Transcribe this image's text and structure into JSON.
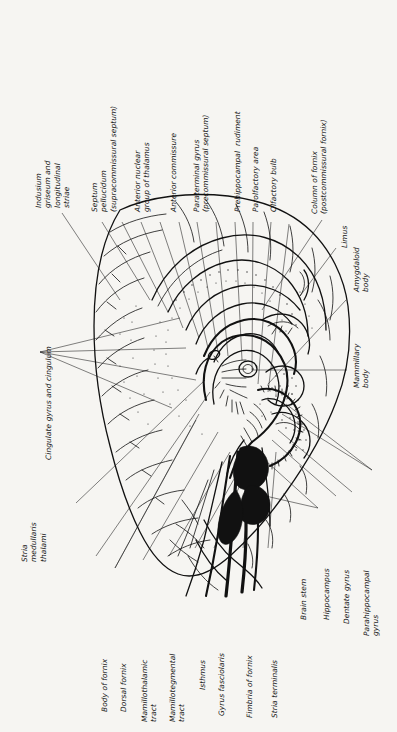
{
  "figure": {
    "background_color": "#f6f5f2",
    "ink_color": "#111111",
    "label_orientation": "rotated-90-ccw",
    "label_style": "italic"
  },
  "labels": {
    "indusium_griseum": "Indusium\ngriseum and\nlongitudinal\nstriae",
    "septum_pellucidum": "Septum\npellucidum\n(supracommissural septum)",
    "anterior_nuclear_group": "Anterior nuclear\ngroup of thalamus",
    "anterior_commissure": "Anterior commissure",
    "paraterminal_gyrus": "Paraterminal gyrus\n(precommissural septum)",
    "prehippocampal_rudiment": "Prehippocampal  rudiment",
    "parolfactory_area": "Parolfactory area",
    "olfactory_bulb": "Olfactory bulb",
    "column_of_fornix": "Column of fornix\n(postcommissural fornix)",
    "limus": "Limus",
    "amygdaloid_body": "Amygdaloid\nbody",
    "mammillary_body": "Mammillary\nbody",
    "cingulate_gyrus": "Cingulate gyrus and cingulum",
    "stria_medullaris": "Stria\nmedullaris\nthalami",
    "body_of_fornix": "Body of fornix",
    "dorsal_fornix": "Dorsal fornix",
    "mamillothalamic_tract": "Mamillothalamic\ntract",
    "mamillotegmental_tract": "Mamillotegmental\ntract",
    "isthmus": "Isthmus",
    "gyrus_fasciolaris": "Gyrus fasciolaris",
    "fimbria_of_fornix": "Fimbria of fornix",
    "stria_terminalis": "Stria terminalis",
    "brain_stem": "Brain stem",
    "hippocampus": "Hippocampus",
    "dentate_gyrus": "Dentate gyrus",
    "parahippocampal_gyrus": "Parahippocampal\ngyrus"
  }
}
